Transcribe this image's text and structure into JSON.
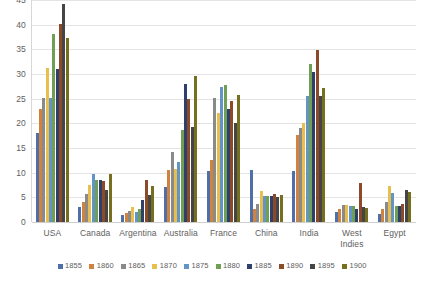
{
  "chart_data": {
    "type": "bar",
    "title": "",
    "subtitle": "",
    "xlabel": "",
    "ylabel": "",
    "ylim": [
      0,
      45
    ],
    "yticks": [
      0,
      5,
      10,
      15,
      20,
      25,
      30,
      35,
      40,
      45
    ],
    "grid": true,
    "legend_position": "bottom",
    "categories": [
      "USA",
      "Canada",
      "Argentina",
      "Australia",
      "France",
      "China",
      "India",
      "West Indies",
      "Egypt"
    ],
    "series": [
      {
        "name": "1855",
        "color": "#4f6fa8",
        "values": [
          18.0,
          3.1,
          1.5,
          7.1,
          10.3,
          10.5,
          10.3,
          2.0,
          1.7
        ]
      },
      {
        "name": "1860",
        "color": "#d0833f",
        "values": [
          22.9,
          4.1,
          1.9,
          10.5,
          12.5,
          2.7,
          17.7,
          2.7,
          2.7
        ]
      },
      {
        "name": "1865",
        "color": "#8a8a8a",
        "values": [
          25.1,
          5.6,
          2.3,
          14.1,
          25.2,
          3.7,
          19.0,
          3.5,
          4.0
        ]
      },
      {
        "name": "1870",
        "color": "#e8bf4e",
        "values": [
          31.2,
          7.6,
          3.1,
          10.7,
          22.0,
          6.3,
          20.0,
          3.5,
          7.2
        ]
      },
      {
        "name": "1875",
        "color": "#6394c6",
        "values": [
          25.1,
          9.7,
          2.1,
          12.2,
          27.3,
          5.2,
          25.5,
          3.2,
          5.8
        ]
      },
      {
        "name": "1880",
        "color": "#6f9f55",
        "values": [
          38.1,
          8.5,
          2.7,
          18.7,
          27.8,
          5.2,
          32.0,
          3.3,
          3.2
        ]
      },
      {
        "name": "1885",
        "color": "#2f3f6b",
        "values": [
          31.0,
          8.5,
          4.5,
          28.0,
          23.0,
          5.2,
          30.5,
          2.7,
          3.3
        ]
      },
      {
        "name": "1890",
        "color": "#8b4a28",
        "values": [
          40.2,
          8.3,
          8.5,
          25.0,
          24.5,
          5.6,
          34.9,
          8.0,
          3.7
        ]
      },
      {
        "name": "1895",
        "color": "#454545",
        "values": [
          44.2,
          6.5,
          5.5,
          19.3,
          20.0,
          5.1,
          25.5,
          3.0,
          6.5
        ]
      },
      {
        "name": "1900",
        "color": "#776f20",
        "values": [
          37.3,
          9.7,
          7.3,
          29.5,
          25.8,
          5.5,
          27.2,
          2.8,
          6.0
        ]
      }
    ]
  },
  "axis": {
    "y_tick_labels": [
      "45",
      "40",
      "35",
      "30",
      "25",
      "20",
      "15",
      "10",
      "5",
      "0"
    ]
  },
  "colors": {
    "background": "#ffffff",
    "gridline": "#e4e4e4",
    "axis_line": "#d7d7d7",
    "text": "#5e5e5e"
  }
}
